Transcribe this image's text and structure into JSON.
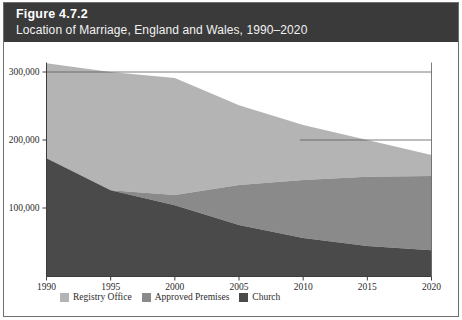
{
  "header": {
    "figure_number": "Figure 4.7.2",
    "subtitle": "Location of Marriage, England and Wales, 1990–2020",
    "background_color": "#3a3a3a",
    "text_color": "#ffffff"
  },
  "legend": {
    "position": "bottom-left",
    "items": [
      {
        "label": "Registry Office",
        "color": "#b4b4b4"
      },
      {
        "label": "Approved Premises",
        "color": "#8a8a8a"
      },
      {
        "label": "Church",
        "color": "#4a4a4a"
      }
    ]
  },
  "axes": {
    "y_ticks": [
      "100,000",
      "200,000",
      "300,000"
    ],
    "x_ticks": [
      "1990",
      "1995",
      "2000",
      "2005",
      "2010",
      "2015",
      "2020"
    ]
  },
  "chart_data": {
    "type": "area",
    "stacked": true,
    "title": "Location of Marriage, England and Wales, 1990–2020",
    "subtitle": "Figure 4.7.2",
    "xlabel": "",
    "ylabel": "",
    "x": [
      1990,
      1995,
      2000,
      2005,
      2010,
      2015,
      2020
    ],
    "categories": [
      "1990",
      "1995",
      "2000",
      "2005",
      "2010",
      "2015",
      "2020"
    ],
    "series": [
      {
        "name": "Church",
        "color": "#4a4a4a",
        "values": [
          173000,
          126000,
          104000,
          75000,
          56000,
          44000,
          38000
        ]
      },
      {
        "name": "Approved Premises",
        "color": "#8a8a8a",
        "values": [
          0,
          0,
          15000,
          59000,
          85000,
          102000,
          109000
        ]
      },
      {
        "name": "Registry Office",
        "color": "#b4b4b4",
        "values": [
          140000,
          174000,
          172000,
          117000,
          81000,
          54000,
          31000
        ]
      }
    ],
    "stack_tops": {
      "church": [
        173000,
        126000,
        104000,
        75000,
        56000,
        44000,
        38000
      ],
      "approved_premises": [
        173000,
        126000,
        119000,
        134000,
        141000,
        146000,
        147000
      ],
      "total": [
        313000,
        300000,
        291000,
        251000,
        222000,
        200000,
        178000
      ]
    },
    "ylim": [
      0,
      330000
    ],
    "xlim": [
      1990,
      2020
    ],
    "ytick_values": [
      100000,
      200000,
      300000
    ],
    "ytick_labels": [
      "100,000",
      "200,000",
      "300,000"
    ],
    "xtick_values": [
      1990,
      1995,
      2000,
      2005,
      2010,
      2015,
      2020
    ],
    "xtick_labels": [
      "1990",
      "1995",
      "2000",
      "2005",
      "2010",
      "2015",
      "2020"
    ],
    "grid": false,
    "gridlines_partial": [
      "horizontal rule at 300,000 across upper plot",
      "horizontal rule at 200,000 across right plot"
    ],
    "legend_position": "bottom-left",
    "plot_background": "#ffffff"
  }
}
